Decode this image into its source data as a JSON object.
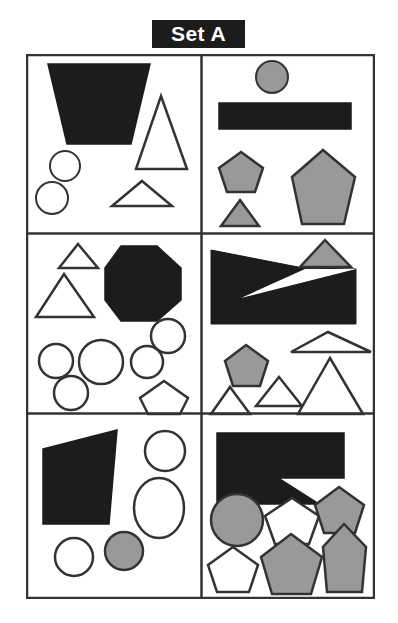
{
  "title": {
    "label": "Set A",
    "text_color": "#ffffff",
    "background_color": "#1c1c1c"
  },
  "canvas": {
    "width": 398,
    "height": 623,
    "background_color": "#ffffff"
  },
  "palette": {
    "black": "#1c1c1c",
    "gray": "#999999",
    "white": "#ffffff",
    "outline": "#333333"
  },
  "grid": {
    "columns": 2,
    "rows": 3,
    "frame": {
      "x": 26,
      "y": 54,
      "width": 349,
      "height": 545
    },
    "border_color": "#333333",
    "border_width": 2,
    "column_divider_x": 175,
    "row_divider_y": [
      178,
      358
    ]
  },
  "panels": [
    {
      "id": "panel-1",
      "position": "top-left",
      "shapes": [
        {
          "name": "black-trapezoid",
          "type": "polygon",
          "fill": "black",
          "points": "20,8 122,8 103,88 39,88"
        },
        {
          "name": "white-circle-upper",
          "type": "circle",
          "fill": "white",
          "cx": 37,
          "cy": 110,
          "r": 15
        },
        {
          "name": "white-circle-lower",
          "type": "circle",
          "fill": "white",
          "cx": 24,
          "cy": 142,
          "r": 16
        },
        {
          "name": "white-tall-triangle",
          "type": "polygon",
          "fill": "white",
          "points": "133,40 159,113 108,113"
        },
        {
          "name": "white-wide-triangle",
          "type": "polygon",
          "fill": "white",
          "points": "114,125 144,150 84,150"
        }
      ]
    },
    {
      "id": "panel-2",
      "position": "top-right",
      "shapes": [
        {
          "name": "gray-circle",
          "type": "circle",
          "fill": "gray",
          "cx": 69,
          "cy": 21,
          "r": 16
        },
        {
          "name": "black-bar",
          "type": "polygon",
          "fill": "black",
          "points": "16,47 148,47 148,73 16,73"
        },
        {
          "name": "gray-small-pentagon",
          "type": "polygon",
          "fill": "gray",
          "points": "38,96 60,112 52,136 24,136 16,112"
        },
        {
          "name": "gray-small-triangle",
          "type": "polygon",
          "fill": "gray",
          "points": "37,144 56,170 18,170"
        },
        {
          "name": "gray-large-pentagon",
          "type": "polygon",
          "fill": "gray",
          "points": "120,94 152,121 141,168 99,168 89,121"
        }
      ]
    },
    {
      "id": "panel-3",
      "position": "middle-left",
      "shapes": [
        {
          "name": "white-small-triangle",
          "type": "polygon",
          "fill": "white",
          "points": "50,8 70,32 31,32"
        },
        {
          "name": "white-large-triangle",
          "type": "polygon",
          "fill": "white",
          "points": "36,38 66,81 8,81"
        },
        {
          "name": "black-octagon",
          "type": "polygon",
          "fill": "black",
          "points": "93,10 129,10 153,32 153,64 129,85 93,85 77,64 77,32"
        },
        {
          "name": "white-circle-right-top",
          "type": "circle",
          "fill": "white",
          "cx": 140,
          "cy": 100,
          "r": 17
        },
        {
          "name": "white-circle-left",
          "type": "circle",
          "fill": "white",
          "cx": 28,
          "cy": 125,
          "r": 17
        },
        {
          "name": "white-circle-center",
          "type": "circle",
          "fill": "white",
          "cx": 73,
          "cy": 126,
          "r": 22
        },
        {
          "name": "white-circle-right-mid",
          "type": "circle",
          "fill": "white",
          "cx": 119,
          "cy": 126,
          "r": 16
        },
        {
          "name": "white-circle-bottom",
          "type": "circle",
          "fill": "white",
          "cx": 43,
          "cy": 157,
          "r": 17
        },
        {
          "name": "white-pentagon",
          "type": "polygon",
          "fill": "white",
          "points": "136,145 160,162 152,178 120,178 112,162"
        }
      ]
    },
    {
      "id": "panel-4",
      "position": "middle-right",
      "shapes": [
        {
          "name": "black-notched-polygon",
          "type": "polygon",
          "fill": "black",
          "points": "8,14 100,32 153,33 153,88 8,88"
        },
        {
          "name": "gray-triangle-top",
          "type": "polygon",
          "fill": "gray",
          "points": "122,4 148,31 97,31"
        },
        {
          "name": "white-wide-triangle",
          "type": "polygon",
          "fill": "gray-none",
          "points": "125,96 168,116 88,116"
        },
        {
          "name": "gray-pentagon",
          "type": "polygon",
          "fill": "gray",
          "points": "43,109 65,125 57,150 30,150 22,125"
        },
        {
          "name": "white-triangle-small-left",
          "type": "polygon",
          "fill": "white",
          "points": "27,151 47,178 8,178"
        },
        {
          "name": "white-triangle-small-mid",
          "type": "polygon",
          "fill": "white",
          "points": "76,141 99,170 53,170"
        },
        {
          "name": "white-triangle-large-right",
          "type": "polygon",
          "fill": "white",
          "points": "127,122 160,178 95,178"
        }
      ]
    },
    {
      "id": "panel-5",
      "position": "bottom-left",
      "shapes": [
        {
          "name": "black-quadrilateral",
          "type": "polygon",
          "fill": "black",
          "points": "15,33 89,14 81,108 15,108"
        },
        {
          "name": "white-circle-top-right",
          "type": "circle",
          "fill": "white",
          "cx": 137,
          "cy": 35,
          "r": 20
        },
        {
          "name": "white-ellipse",
          "type": "ellipse",
          "fill": "white",
          "cx": 131,
          "cy": 92,
          "rx": 25,
          "ry": 30
        },
        {
          "name": "gray-circle",
          "type": "circle",
          "fill": "gray",
          "cx": 96,
          "cy": 135,
          "r": 19
        },
        {
          "name": "white-circle-bottom",
          "type": "circle",
          "fill": "white",
          "cx": 46,
          "cy": 141,
          "r": 19
        }
      ]
    },
    {
      "id": "panel-6",
      "position": "bottom-right",
      "shapes": [
        {
          "name": "black-wedge-polygon",
          "type": "polygon",
          "fill": "black",
          "points": "14,17 141,17 141,62 75,62 116,88 14,88"
        },
        {
          "name": "gray-circle",
          "type": "circle",
          "fill": "gray",
          "cx": 34,
          "cy": 104,
          "r": 26
        },
        {
          "name": "white-pentagon-mid",
          "type": "polygon",
          "fill": "white",
          "points": "89,82 116,100 106,128 72,128 62,100"
        },
        {
          "name": "gray-pentagon-top-right",
          "type": "polygon",
          "fill": "gray",
          "points": "136,71 161,89 152,117 121,117 112,89"
        },
        {
          "name": "white-pentagon-bottom-left",
          "type": "polygon",
          "fill": "white",
          "points": "30,131 55,149 46,176 14,176 5,149"
        },
        {
          "name": "gray-pentagon-large",
          "type": "polygon",
          "fill": "gray",
          "points": "88,118 119,141 108,178 69,178 58,141"
        },
        {
          "name": "gray-pentagon-tall",
          "type": "polygon",
          "fill": "gray",
          "points": "141,108 163,131 159,176 124,176 120,131"
        }
      ]
    }
  ]
}
